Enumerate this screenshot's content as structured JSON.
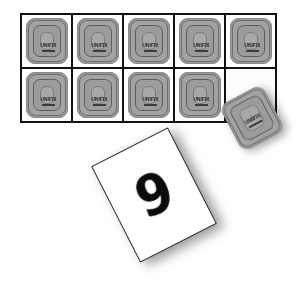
{
  "scene": {
    "background_color": "#ffffff",
    "width": 297,
    "height": 290
  },
  "grid": {
    "name": "ten-frame-grid",
    "columns": 5,
    "rows": 2,
    "total_cells": 10,
    "filled_cells": 9,
    "empty_cells": 1,
    "border_color": "#111111",
    "cell_background": "#ffffff",
    "cells": [
      {
        "index": 1,
        "filled": true,
        "tile_label": "UNIFIX"
      },
      {
        "index": 2,
        "filled": true,
        "tile_label": "UNIFIX"
      },
      {
        "index": 3,
        "filled": true,
        "tile_label": "UNIFIX"
      },
      {
        "index": 4,
        "filled": true,
        "tile_label": "UNIFIX"
      },
      {
        "index": 5,
        "filled": true,
        "tile_label": "UNIFIX"
      },
      {
        "index": 6,
        "filled": true,
        "tile_label": "UNIFIX"
      },
      {
        "index": 7,
        "filled": true,
        "tile_label": "UNIFIX"
      },
      {
        "index": 8,
        "filled": true,
        "tile_label": "UNIFIX"
      },
      {
        "index": 9,
        "filled": true,
        "tile_label": "UNIFIX"
      },
      {
        "index": 10,
        "filled": false,
        "tile_label": ""
      }
    ]
  },
  "tile": {
    "brand_label": "UNIFIX",
    "body_color": "#9a9a9a",
    "face_color": "#8f8f8f",
    "stud_color": "#f4f4f4",
    "outline_color": "#5e5e5e",
    "text_color": "#1e1e1e"
  },
  "loose_tile": {
    "name": "loose-unifix-tile",
    "brand_label": "UNIFIX",
    "rotation_degrees": -28,
    "has_shadow": true
  },
  "number_card": {
    "name": "number-card",
    "digit": "9",
    "background_color": "#ffffff",
    "border_color": "#2c2c2c",
    "digit_color": "#0b0b0b",
    "rotation_degrees": -27,
    "has_shadow": true
  }
}
